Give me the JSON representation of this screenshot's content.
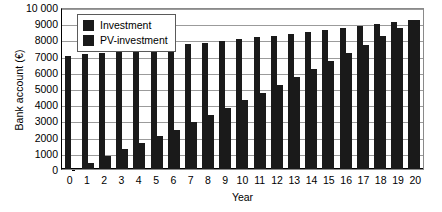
{
  "chart_data": {
    "type": "bar",
    "title": "",
    "xlabel": "Year",
    "ylabel": "Bank account (€)",
    "ylim": [
      0,
      10000
    ],
    "ytick_labels": [
      "10 000",
      "9000",
      "8000",
      "7000",
      "6000",
      "5000",
      "4000",
      "3000",
      "2000",
      "1000",
      "0"
    ],
    "ytick_values": [
      10000,
      9000,
      8000,
      7000,
      6000,
      5000,
      4000,
      3000,
      2000,
      1000,
      0
    ],
    "grid": true,
    "legend_position": "top-left",
    "categories": [
      "0",
      "1",
      "2",
      "3",
      "4",
      "5",
      "6",
      "7",
      "8",
      "9",
      "10",
      "11",
      "12",
      "13",
      "14",
      "15",
      "16",
      "17",
      "18",
      "19",
      "20"
    ],
    "series": [
      {
        "name": "Investment",
        "color": "#1a1a1a",
        "values": [
          6980,
          7080,
          7180,
          7280,
          7390,
          7480,
          7580,
          7690,
          7800,
          7900,
          8010,
          8120,
          8240,
          8350,
          8470,
          8600,
          8720,
          8850,
          8980,
          9100,
          9220
        ]
      },
      {
        "name": "PV-investment",
        "color": "#1a1a1a",
        "values": [
          0,
          400,
          810,
          1210,
          1610,
          2030,
          2430,
          2880,
          3340,
          3780,
          4250,
          4700,
          5200,
          5660,
          6160,
          6650,
          7140,
          7680,
          8180,
          8680,
          9220
        ]
      }
    ]
  },
  "legend": {
    "items": [
      {
        "label": "Investment",
        "swatch_color": "#1a1a1a"
      },
      {
        "label": "PV-investment",
        "swatch_color": "#1a1a1a"
      }
    ]
  },
  "colors": {
    "bar": "#1a1a1a",
    "grid": "#9b9b9b",
    "axis": "#000000",
    "background": "#ffffff"
  }
}
